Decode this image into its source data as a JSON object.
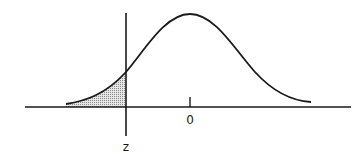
{
  "diagram": {
    "type": "normal-distribution-curve",
    "labels": {
      "mean": "0",
      "cutoff": "z"
    },
    "shaded_region": "left tail, area to the left of z",
    "colors": {
      "line": "#1a1a1a",
      "shade": "#b8b8b8",
      "background": "#ffffff"
    }
  }
}
